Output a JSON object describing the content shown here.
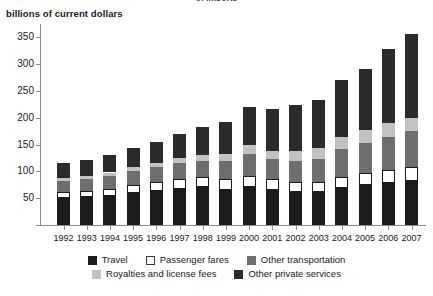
{
  "clipped_header": "of imports",
  "axis_caption": "billions of current dollars",
  "chart_data": {
    "type": "bar",
    "stacked": true,
    "title": "",
    "subtitle": "",
    "xlabel": "",
    "ylabel": "billions of current dollars",
    "ylim": [
      0,
      375
    ],
    "yticks": [
      0,
      50,
      100,
      150,
      200,
      250,
      300,
      350
    ],
    "ytick_labels": [
      "",
      "50",
      "100",
      "150",
      "200",
      "250",
      "300",
      "350"
    ],
    "grid": false,
    "legend_position": "bottom",
    "categories": [
      "1992",
      "1993",
      "1994",
      "1995",
      "1996",
      "1997",
      "1998",
      "1999",
      "2000",
      "2001",
      "2002",
      "2003",
      "2004",
      "2005",
      "2006",
      "2007"
    ],
    "series": [
      {
        "name": "Travel",
        "color": "#1c1c1c",
        "values": [
          51,
          52,
          54,
          59,
          64,
          68,
          70,
          66,
          70,
          65,
          62,
          61,
          69,
          74,
          78,
          83
        ]
      },
      {
        "name": "Passenger fares",
        "color": "#ffffff",
        "values": [
          11,
          12,
          13,
          15,
          16,
          18,
          19,
          20,
          22,
          20,
          19,
          19,
          21,
          23,
          25,
          26
        ]
      },
      {
        "name": "Other transportation",
        "color": "#6e6e6e",
        "values": [
          21,
          22,
          25,
          27,
          28,
          30,
          31,
          34,
          41,
          38,
          39,
          44,
          51,
          56,
          61,
          66
        ]
      },
      {
        "name": "Royalties and license fees",
        "color": "#c2c2c2",
        "values": [
          5,
          5,
          6,
          7,
          8,
          9,
          11,
          13,
          16,
          16,
          19,
          20,
          23,
          25,
          26,
          25
        ]
      },
      {
        "name": "Other private services",
        "color": "#2b2b2b",
        "values": [
          28,
          31,
          33,
          36,
          39,
          45,
          51,
          59,
          72,
          77,
          84,
          90,
          107,
          113,
          139,
          157
        ]
      }
    ],
    "totals": [
      116,
      122,
      131,
      144,
      155,
      170,
      182,
      192,
      221,
      216,
      223,
      234,
      271,
      291,
      329,
      357
    ]
  },
  "legend": {
    "rows": [
      [
        {
          "label": "Travel",
          "swatch": "sw-travel",
          "icon": "legend-swatch-travel"
        },
        {
          "label": "Passenger fares",
          "swatch": "sw-fares",
          "icon": "legend-swatch-passenger-fares"
        },
        {
          "label": "Other transportation",
          "swatch": "sw-othtrans",
          "icon": "legend-swatch-other-transportation"
        }
      ],
      [
        {
          "label": "Royalties and license fees",
          "swatch": "sw-royal",
          "icon": "legend-swatch-royalties"
        },
        {
          "label": "Other private services",
          "swatch": "sw-othpriv",
          "icon": "legend-swatch-other-private-services"
        }
      ]
    ]
  }
}
